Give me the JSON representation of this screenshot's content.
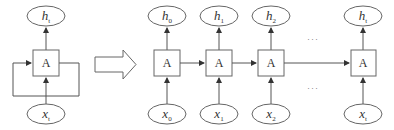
{
  "diagram": {
    "type": "rnn-unrolling",
    "colors": {
      "stroke": "#555555",
      "fill": "#ffffff",
      "text": "#333333"
    },
    "folded": {
      "cell_label": "A",
      "output": {
        "base": "h",
        "sub": "t"
      },
      "input": {
        "base": "x",
        "sub": "t"
      }
    },
    "transform_arrow": "right-hollow-arrow",
    "unrolled": {
      "cells": [
        {
          "cell_label": "A",
          "output": {
            "base": "h",
            "sub": "0"
          },
          "input": {
            "base": "x",
            "sub": "0"
          }
        },
        {
          "cell_label": "A",
          "output": {
            "base": "h",
            "sub": "1"
          },
          "input": {
            "base": "x",
            "sub": "1"
          }
        },
        {
          "cell_label": "A",
          "output": {
            "base": "h",
            "sub": "2"
          },
          "input": {
            "base": "x",
            "sub": "2"
          }
        },
        {
          "cell_label": "A",
          "output": {
            "base": "h",
            "sub": "t"
          },
          "input": {
            "base": "x",
            "sub": "t"
          }
        }
      ],
      "ellipsis_top": "···",
      "ellipsis_bottom": "···"
    }
  }
}
